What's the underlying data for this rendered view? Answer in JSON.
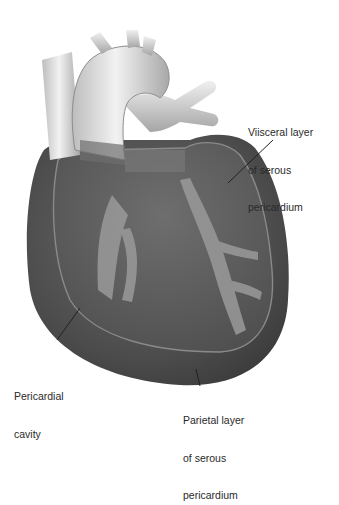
{
  "diagram": {
    "labels": {
      "visceral": {
        "lines": [
          "Viisceral layer",
          "of serous",
          "pericardium"
        ]
      },
      "cavity": {
        "lines": [
          "Pericardial",
          "cavity"
        ]
      },
      "parietal": {
        "lines": [
          "Parietal layer",
          "of serous",
          "pericardium"
        ]
      }
    },
    "colors": {
      "background": "#ffffff",
      "pericardium_dark": "#4a4a4a",
      "heart_surface": "#5e5e5e",
      "vessel_light": "#e6e6e6",
      "coronary": "#9a9a9a",
      "leader_line": "#222222"
    }
  }
}
